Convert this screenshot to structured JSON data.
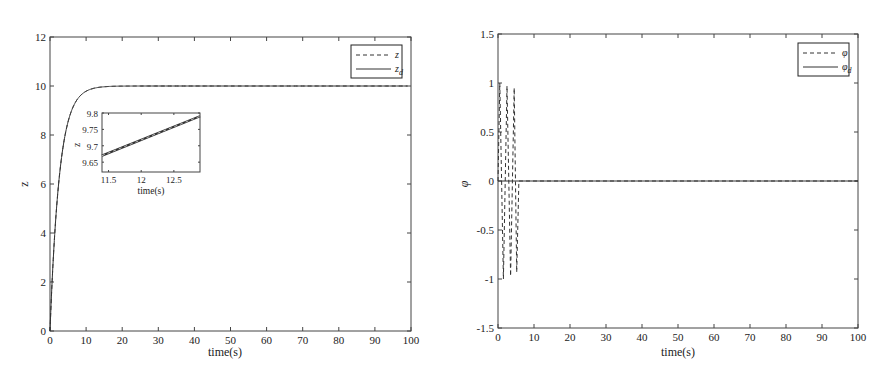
{
  "chart_data": [
    {
      "type": "line",
      "title": "",
      "xlabel": "time(s)",
      "ylabel": "z",
      "xlim": [
        0,
        100
      ],
      "ylim": [
        0,
        12
      ],
      "xticks": [
        "0",
        "10",
        "20",
        "30",
        "40",
        "50",
        "60",
        "70",
        "80",
        "90",
        "100"
      ],
      "yticks": [
        "0",
        "2",
        "4",
        "6",
        "8",
        "10",
        "12"
      ],
      "grid": false,
      "legend_position": "upper right",
      "series": [
        {
          "name": "z",
          "style": "dashed",
          "x": [
            0,
            1,
            2,
            3,
            4,
            5,
            6,
            8,
            10,
            12,
            15,
            20,
            30,
            50,
            100
          ],
          "values": [
            0,
            3.3,
            5.5,
            7.0,
            8.0,
            8.6,
            9.1,
            9.5,
            9.75,
            9.85,
            9.95,
            9.99,
            10,
            10,
            10
          ]
        },
        {
          "name": "z_d",
          "style": "solid",
          "x": [
            0,
            1,
            2,
            3,
            4,
            5,
            6,
            8,
            10,
            12,
            15,
            20,
            30,
            50,
            100
          ],
          "values": [
            0,
            3.3,
            5.5,
            7.0,
            8.0,
            8.6,
            9.1,
            9.5,
            9.75,
            9.85,
            9.95,
            9.99,
            10,
            10,
            10
          ]
        }
      ],
      "inset": {
        "xlabel": "time(s)",
        "ylabel": "z",
        "xlim": [
          11.4,
          12.9
        ],
        "ylim": [
          9.62,
          9.8
        ],
        "xticks": [
          "11.5",
          "12",
          "12.5"
        ],
        "yticks": [
          "9.65",
          "9.7",
          "9.75",
          "9.8"
        ],
        "series": [
          {
            "name": "z",
            "style": "dashed",
            "x": [
              11.4,
              12.9
            ],
            "values": [
              9.67,
              9.79
            ]
          },
          {
            "name": "z_d",
            "style": "solid",
            "x": [
              11.4,
              12.9
            ],
            "values": [
              9.67,
              9.79
            ]
          }
        ]
      }
    },
    {
      "type": "line",
      "title": "",
      "xlabel": "time(s)",
      "ylabel": "φ",
      "xlim": [
        0,
        100
      ],
      "ylim": [
        -1.5,
        1.5
      ],
      "xticks": [
        "0",
        "10",
        "20",
        "30",
        "40",
        "50",
        "60",
        "70",
        "80",
        "90",
        "100"
      ],
      "yticks": [
        "-1.5",
        "-1",
        "-0.5",
        "0",
        "0.5",
        "1",
        "1.5"
      ],
      "grid": false,
      "legend_position": "upper right",
      "series": [
        {
          "name": "φ",
          "style": "dashed",
          "x": [
            0,
            0.5,
            1.5,
            2.5,
            3.5,
            4.5,
            5.2,
            5.8,
            100
          ],
          "values": [
            0,
            1,
            -1,
            0.97,
            -0.97,
            0.95,
            -0.93,
            0,
            0
          ]
        },
        {
          "name": "φ_d",
          "style": "solid",
          "x": [
            0,
            100
          ],
          "values": [
            0,
            0
          ]
        }
      ]
    }
  ],
  "left": {
    "ylabel": "z",
    "xlabel": "time(s)",
    "legend": [
      {
        "label": "z",
        "sub": ""
      },
      {
        "label": "z",
        "sub": "d"
      }
    ],
    "inset": {
      "xlabel": "time(s)",
      "ylabel": "z"
    }
  },
  "right": {
    "ylabel": "φ",
    "xlabel": "time(s)",
    "legend": [
      {
        "label": "φ",
        "sub": ""
      },
      {
        "label": "φ",
        "sub": "d"
      }
    ]
  },
  "colors": {
    "line": "#333333",
    "axis": "#444444"
  }
}
